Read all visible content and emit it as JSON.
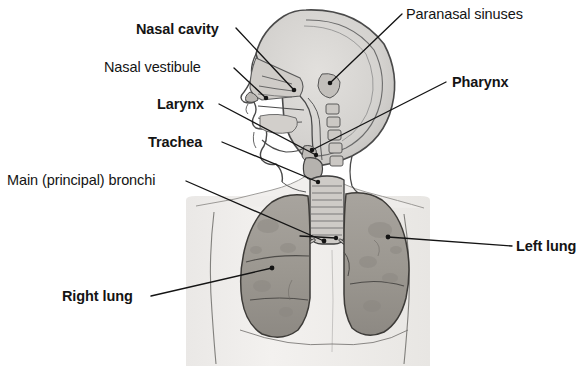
{
  "figure": {
    "view": "anterior thorax with midsagittal head section",
    "background_color": "#ffffff",
    "ink_color": "#141414",
    "body_tint_color": "#f0eeec",
    "skull_tint_color": "#d8d6d3",
    "lung_fill_color": "#9e9a94",
    "lung_shadow_color": "#807c77",
    "outline_color": "#3a3a3a"
  },
  "labels": {
    "nasal_cavity": "Nasal cavity",
    "nasal_vestibule": "Nasal vestibule",
    "larynx": "Larynx",
    "trachea": "Trachea",
    "main_bronchi": "Main (principal) bronchi",
    "right_lung": "Right lung",
    "paranasal_sinuses": "Paranasal sinuses",
    "pharynx": "Pharynx",
    "left_lung": "Left lung"
  },
  "label_styles": {
    "nasal_cavity": "bold",
    "nasal_vestibule": "regular",
    "larynx": "bold",
    "trachea": "bold",
    "main_bronchi": "regular",
    "right_lung": "bold",
    "paranasal_sinuses": "regular",
    "pharynx": "bold",
    "left_lung": "bold"
  },
  "leader_lines": {
    "nasal_cavity": {
      "from": [
        236,
        28
      ],
      "to": [
        294,
        90
      ]
    },
    "nasal_vestibule": {
      "from": [
        234,
        68
      ],
      "to": [
        266,
        98
      ]
    },
    "larynx": {
      "from": [
        219,
        104
      ],
      "to": [
        316,
        155
      ]
    },
    "trachea": {
      "from": [
        222,
        142
      ],
      "to": [
        318,
        182
      ]
    },
    "main_bronchi": {
      "from": [
        186,
        181
      ],
      "to": [
        324,
        241
      ]
    },
    "right_lung": {
      "from": [
        151,
        296
      ],
      "to": [
        272,
        268
      ]
    },
    "paranasal_sinuses": {
      "from": [
        402,
        14
      ],
      "to": [
        330,
        83
      ]
    },
    "pharynx": {
      "from": [
        446,
        82
      ],
      "to": [
        312,
        150
      ]
    },
    "left_lung": {
      "from": [
        512,
        246
      ],
      "to": [
        388,
        237
      ]
    }
  }
}
